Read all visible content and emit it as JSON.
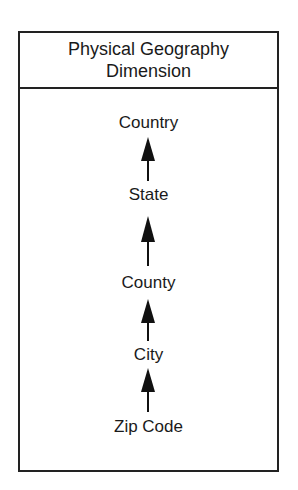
{
  "title": {
    "line1": "Physical Geography",
    "line2": "Dimension"
  },
  "levels": [
    {
      "label": "Country"
    },
    {
      "label": "State"
    },
    {
      "label": "County"
    },
    {
      "label": "City"
    },
    {
      "label": "Zip Code"
    }
  ],
  "arrows": [
    {
      "from": "State",
      "to": "Country"
    },
    {
      "from": "County",
      "to": "State"
    },
    {
      "from": "City",
      "to": "County"
    },
    {
      "from": "Zip Code",
      "to": "City"
    }
  ],
  "colors": {
    "stroke": "#222222",
    "text": "#1a1a1a",
    "background": "#ffffff"
  }
}
